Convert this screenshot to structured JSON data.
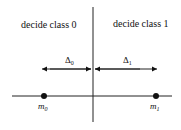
{
  "diagram": {
    "regions": [
      {
        "label": "decide class 0",
        "side": "left"
      },
      {
        "label": "decide class 1",
        "side": "right"
      }
    ],
    "distances": [
      {
        "symbol": "Δ",
        "subscript": "0"
      },
      {
        "symbol": "Δ",
        "subscript": "1"
      }
    ],
    "points": [
      {
        "symbol": "m",
        "subscript": "0"
      },
      {
        "symbol": "m",
        "subscript": "1"
      }
    ]
  }
}
